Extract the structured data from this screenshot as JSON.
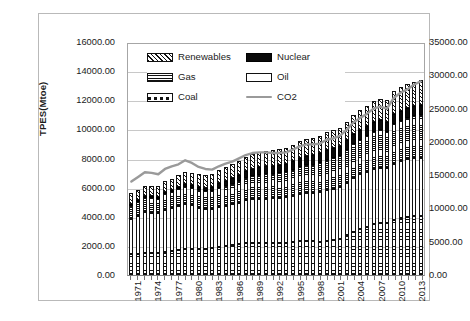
{
  "chart_data": {
    "type": "bar",
    "subtype": "stacked-bar-plus-line",
    "title": "",
    "xlabel": "",
    "ylabel": "TPES(Mtoe)",
    "y2label": "CO2 emissions (Mtc)",
    "ylim": [
      0,
      16000
    ],
    "y2lim": [
      0,
      35000
    ],
    "ytick_step": 2000,
    "y2tick_step": 5000,
    "grid": true,
    "legend_position": "top-left-inside",
    "yticks": [
      "0.00",
      "2000.00",
      "4000.00",
      "6000.00",
      "8000.00",
      "10000.00",
      "12000.00",
      "14000.00",
      "16000.00"
    ],
    "y2ticks": [
      "0.00",
      "5000.00",
      "10000.00",
      "15000.00",
      "20000.00",
      "25000.00",
      "30000.00",
      "35000.00"
    ],
    "x": [
      1971,
      1972,
      1973,
      1974,
      1975,
      1976,
      1977,
      1978,
      1979,
      1980,
      1981,
      1982,
      1983,
      1984,
      1985,
      1986,
      1987,
      1988,
      1989,
      1990,
      1991,
      1992,
      1993,
      1994,
      1995,
      1996,
      1997,
      1998,
      1999,
      2000,
      2001,
      2002,
      2003,
      2004,
      2005,
      2006,
      2007,
      2008,
      2009,
      2010,
      2011,
      2012,
      2013,
      2014
    ],
    "xtick_labels": [
      "1971",
      "1974",
      "1977",
      "1980",
      "1983",
      "1986",
      "1989",
      "1992",
      "1995",
      "1998",
      "2001",
      "2004",
      "2007",
      "2010",
      "2013"
    ],
    "legend": [
      "Renewables",
      "Nuclear",
      "Gas",
      "Oil",
      "Coal",
      "CO2"
    ],
    "stack_order_bottom_to_top": [
      "Coal",
      "Oil",
      "Gas",
      "Nuclear",
      "Renewables"
    ],
    "series": [
      {
        "name": "Coal",
        "unit": "Mtoe",
        "axis": "left",
        "values": [
          1440,
          1470,
          1500,
          1500,
          1530,
          1600,
          1650,
          1690,
          1780,
          1800,
          1790,
          1800,
          1840,
          1930,
          2010,
          2040,
          2110,
          2180,
          2210,
          2220,
          2200,
          2180,
          2190,
          2210,
          2260,
          2310,
          2330,
          2310,
          2300,
          2360,
          2420,
          2500,
          2760,
          2960,
          3140,
          3300,
          3470,
          3560,
          3560,
          3760,
          3940,
          4000,
          4060,
          4040
        ]
      },
      {
        "name": "Oil",
        "unit": "Mtoe",
        "axis": "left",
        "values": [
          2440,
          2610,
          2810,
          2760,
          2720,
          2890,
          2970,
          3070,
          3120,
          2980,
          2840,
          2740,
          2690,
          2730,
          2720,
          2810,
          2860,
          2950,
          3000,
          3030,
          3040,
          3080,
          3070,
          3120,
          3170,
          3250,
          3330,
          3340,
          3420,
          3470,
          3490,
          3510,
          3580,
          3720,
          3770,
          3800,
          3840,
          3810,
          3760,
          3860,
          3890,
          3940,
          3980,
          4020
        ]
      },
      {
        "name": "Gas",
        "unit": "Mtoe",
        "axis": "left",
        "values": [
          890,
          940,
          980,
          1000,
          1000,
          1060,
          1080,
          1120,
          1180,
          1200,
          1210,
          1220,
          1240,
          1320,
          1370,
          1400,
          1470,
          1530,
          1590,
          1650,
          1680,
          1690,
          1720,
          1730,
          1790,
          1880,
          1890,
          1930,
          1990,
          2070,
          2110,
          2160,
          2230,
          2300,
          2360,
          2420,
          2510,
          2560,
          2510,
          2720,
          2780,
          2860,
          2900,
          2930
        ]
      },
      {
        "name": "Nuclear",
        "unit": "Mtoe",
        "axis": "left",
        "values": [
          29,
          38,
          48,
          59,
          86,
          105,
          130,
          160,
          165,
          186,
          225,
          230,
          263,
          320,
          380,
          410,
          440,
          470,
          490,
          520,
          540,
          550,
          570,
          580,
          600,
          620,
          610,
          630,
          650,
          670,
          680,
          690,
          680,
          710,
          720,
          720,
          710,
          710,
          700,
          720,
          670,
          640,
          650,
          660
        ]
      },
      {
        "name": "Renewables",
        "unit": "Mtoe",
        "axis": "left",
        "values": [
          700,
          710,
          720,
          740,
          750,
          760,
          780,
          800,
          820,
          840,
          850,
          860,
          880,
          900,
          930,
          950,
          970,
          990,
          1010,
          1030,
          1050,
          1060,
          1090,
          1100,
          1130,
          1160,
          1170,
          1190,
          1210,
          1230,
          1240,
          1260,
          1290,
          1320,
          1350,
          1390,
          1430,
          1470,
          1490,
          1560,
          1600,
          1650,
          1700,
          1740
        ]
      },
      {
        "name": "CO2",
        "unit": "Mtc",
        "axis": "right",
        "values": [
          14100,
          14800,
          15500,
          15400,
          15200,
          16000,
          16400,
          16700,
          17300,
          16900,
          16300,
          16000,
          15900,
          16400,
          16800,
          17100,
          17600,
          18100,
          18400,
          18500,
          18500,
          18400,
          18400,
          18500,
          18900,
          19400,
          19700,
          19700,
          19800,
          20400,
          20600,
          21000,
          21900,
          23000,
          23700,
          24300,
          25100,
          25400,
          25100,
          26700,
          27500,
          28000,
          28700,
          29200
        ]
      }
    ]
  },
  "legend_labels": {
    "renewables": "Renewables",
    "nuclear": "Nuclear",
    "gas": "Gas",
    "oil": "Oil",
    "coal": "Coal",
    "co2": "CO2"
  },
  "axes": {
    "left_title": "TPES(Mtoe)",
    "right_title": "CO2 emissions (Mtc)"
  },
  "colors": {
    "co2_line": "#9a9a9a",
    "grid": "#c8c8c8",
    "axis": "#7f7f7f",
    "frame": "#b9b9b9",
    "nuclear_fill": "#0a0a0a",
    "oil_fill": "#ffffff"
  }
}
